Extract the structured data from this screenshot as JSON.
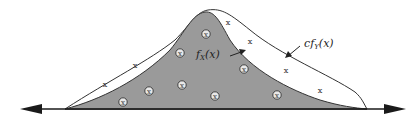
{
  "diagram": {
    "type": "rejection-sampling-illustration",
    "labels": {
      "target": {
        "prefix": "f",
        "sub": "X",
        "suffix": "(x)"
      },
      "envelope": {
        "prefix": "cf",
        "sub": "Y",
        "suffix": "(x)"
      }
    },
    "markers": {
      "accepted_symbol": "circled-point",
      "rejected_symbol": "x",
      "accepted": [
        [
          123,
          102
        ],
        [
          149,
          91
        ],
        [
          182,
          85
        ],
        [
          215,
          96
        ],
        [
          180,
          53
        ],
        [
          206,
          34
        ],
        [
          244,
          69
        ],
        [
          277,
          95
        ]
      ],
      "rejected": [
        [
          105,
          84
        ],
        [
          135,
          65
        ],
        [
          228,
          22
        ],
        [
          250,
          41
        ],
        [
          286,
          70
        ],
        [
          320,
          90
        ]
      ]
    },
    "colors": {
      "fill_target": "#9a9a9a",
      "envelope_fill": "#ffffff",
      "stroke": "#333333",
      "axis": "#1a1a1a"
    }
  }
}
